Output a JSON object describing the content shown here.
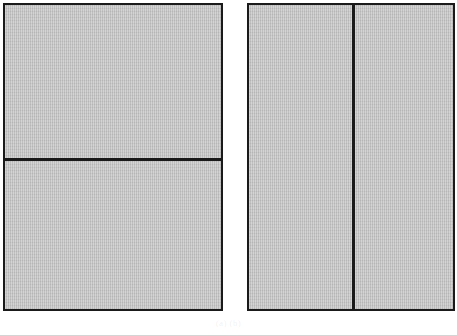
{
  "figure": {
    "caption": "(a)                    (b)",
    "background_color": "#ffffff",
    "panel_fill_color": "#c2c2c2",
    "panel_border_color": "#1a1a1a",
    "divider_color": "#1a1a1a"
  },
  "panels": [
    {
      "id": "left",
      "label": "",
      "split_orientation": "horizontal",
      "regions": [
        {
          "id": "left-top",
          "label": ""
        },
        {
          "id": "left-bottom",
          "label": ""
        }
      ]
    },
    {
      "id": "right",
      "label": "",
      "split_orientation": "vertical",
      "regions": [
        {
          "id": "right-left",
          "label": ""
        },
        {
          "id": "right-right",
          "label": ""
        }
      ]
    }
  ]
}
